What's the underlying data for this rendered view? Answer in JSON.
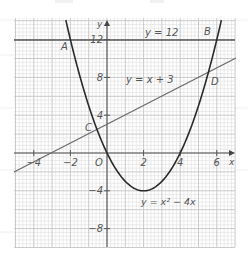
{
  "figure": {
    "axes": {
      "x_label": "x",
      "y_label": "y",
      "origin_label": "O",
      "x_ticks": [
        {
          "value": -4,
          "label": "−4"
        },
        {
          "value": -2,
          "label": "−2"
        },
        {
          "value": 2,
          "label": "2"
        },
        {
          "value": 4,
          "label": "4"
        },
        {
          "value": 6,
          "label": "6"
        }
      ],
      "y_ticks": [
        {
          "value": 12,
          "label": "12"
        },
        {
          "value": 8,
          "label": "8"
        },
        {
          "value": 4,
          "label": "4"
        },
        {
          "value": -4,
          "label": "−4"
        },
        {
          "value": -8,
          "label": "−8"
        }
      ]
    },
    "curves": {
      "horizontal": {
        "label": "y = 12",
        "equation": "y = 12"
      },
      "line": {
        "label": "y = x + 3",
        "equation": "y = x + 3"
      },
      "parabola": {
        "label": "y = x² − 4x",
        "equation": "y = x^2 - 4x"
      }
    },
    "points": [
      {
        "name": "A",
        "label": "A",
        "x": -2,
        "y": 12
      },
      {
        "name": "B",
        "label": "B",
        "x": 6,
        "y": 12
      },
      {
        "name": "C",
        "label": "C",
        "x": -0.54,
        "y": 2.46
      },
      {
        "name": "D",
        "label": "D",
        "x": 5.54,
        "y": 8.54
      }
    ],
    "colors": {
      "curve": "#2a2a2a",
      "line": "#666666",
      "axis": "#555555",
      "grid_major": "#c4c4c4",
      "grid_minor": "#e2e2e2",
      "text": "#555555"
    }
  },
  "chart_data": {
    "type": "line",
    "title": "",
    "xlabel": "x",
    "ylabel": "y",
    "xlim": [
      -5,
      7
    ],
    "ylim": [
      -10,
      14
    ],
    "grid": true,
    "series": [
      {
        "name": "y = 12",
        "x": [
          -5,
          7
        ],
        "y": [
          12,
          12
        ]
      },
      {
        "name": "y = x + 3",
        "x": [
          -5,
          7
        ],
        "y": [
          -2,
          10
        ]
      },
      {
        "name": "y = x² − 4x",
        "x": [
          -2.2,
          -2,
          -1,
          0,
          1,
          2,
          3,
          4,
          5,
          6,
          6.2
        ],
        "y": [
          13.64,
          12,
          5,
          0,
          -3,
          -4,
          -3,
          0,
          5,
          12,
          13.64
        ]
      }
    ],
    "annotations": [
      {
        "text": "A",
        "x": -2,
        "y": 12
      },
      {
        "text": "B",
        "x": 6,
        "y": 12
      },
      {
        "text": "C",
        "x": -0.54,
        "y": 2.46
      },
      {
        "text": "D",
        "x": 5.54,
        "y": 8.54
      },
      {
        "text": "O",
        "x": 0,
        "y": 0
      }
    ]
  }
}
